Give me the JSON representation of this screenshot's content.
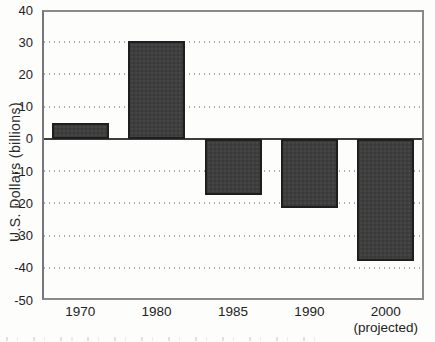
{
  "figure": {
    "background": "#fdfdfc"
  },
  "chart_data": {
    "type": "bar",
    "title": "",
    "xlabel": "",
    "ylabel": "U.S. Dollars (billions)",
    "categories": [
      "1970",
      "1980",
      "1985",
      "1990",
      "2000"
    ],
    "category_sublabels": [
      "",
      "",
      "",
      "",
      "(projected)"
    ],
    "values": [
      5,
      30.5,
      -17.5,
      -21.5,
      -38
    ],
    "ylim": [
      -50,
      40
    ],
    "yticks": [
      40,
      30,
      20,
      10,
      0,
      -10,
      -20,
      -30,
      -40,
      -50
    ],
    "grid": "horizontal-dotted",
    "legend": "none",
    "bar_fill_color": "#3e3e3e",
    "bar_border_color": "#1e1e1e",
    "frame_color": "#8a8a8a",
    "gridline_color": "#9a9a9a",
    "zero_line_color": "#3d3d3d",
    "text_color": "#222222"
  }
}
